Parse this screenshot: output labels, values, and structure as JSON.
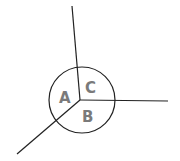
{
  "diagram": {
    "regions": [
      {
        "label": "A"
      },
      {
        "label": "B"
      },
      {
        "label": "C"
      }
    ],
    "colors": {
      "stroke": "#222222",
      "label": "#7a7a7a",
      "background": "#ffffff"
    }
  }
}
